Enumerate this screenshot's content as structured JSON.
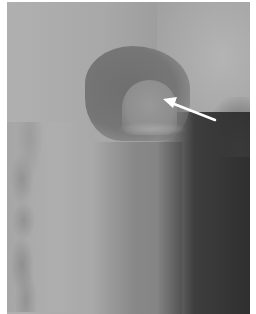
{
  "image": {
    "type": "radiograph",
    "description": "Lateral neck X-ray with white arrow pointing to a rounded soft-tissue density in a dark air space",
    "annotation": {
      "type": "arrow",
      "color": "#ffffff",
      "tip": [
        163,
        100
      ],
      "tail": [
        215,
        120
      ]
    },
    "colors": {
      "background_gray": "#a9a9a9",
      "dark_airway": "#2f2f2f",
      "cavity": "#6f6f6f",
      "border": "#ffffff"
    }
  }
}
